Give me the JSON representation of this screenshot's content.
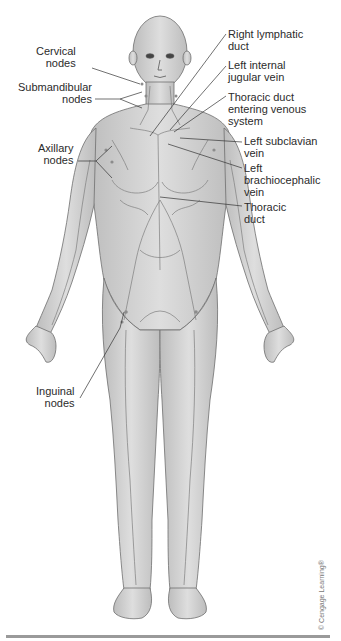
{
  "figure": {
    "labels_left": [
      {
        "id": "cervical-nodes",
        "lines": [
          "Cervical",
          "nodes"
        ]
      },
      {
        "id": "submandibular-nodes",
        "lines": [
          "Submandibular",
          "nodes"
        ]
      },
      {
        "id": "axillary-nodes",
        "lines": [
          "Axillary",
          "nodes"
        ]
      },
      {
        "id": "inguinal-nodes",
        "lines": [
          "Inguinal",
          "nodes"
        ]
      }
    ],
    "labels_right": [
      {
        "id": "right-lymphatic-duct",
        "lines": [
          "Right lymphatic",
          "duct"
        ]
      },
      {
        "id": "left-internal-jugular-vein",
        "lines": [
          "Left internal",
          "jugular vein"
        ]
      },
      {
        "id": "thoracic-duct-entering-venous-system",
        "lines": [
          "Thoracic duct",
          "entering venous",
          "system"
        ]
      },
      {
        "id": "left-subclavian-vein",
        "lines": [
          "Left subclavian",
          "vein"
        ]
      },
      {
        "id": "left-brachiocephalic-vein",
        "lines": [
          "Left",
          "brachiocephalic",
          "vein"
        ]
      },
      {
        "id": "thoracic-duct",
        "lines": [
          "Thoracic",
          "duct"
        ]
      }
    ],
    "copyright": "© Cengage Learning®",
    "colors": {
      "skin": "#d4d4d4",
      "skin_shadow": "#a9a9a9",
      "outline": "#6f6f6f",
      "vessel": "#7e7e7e",
      "leader": "#333333",
      "rule": "#9a9a9a"
    }
  }
}
